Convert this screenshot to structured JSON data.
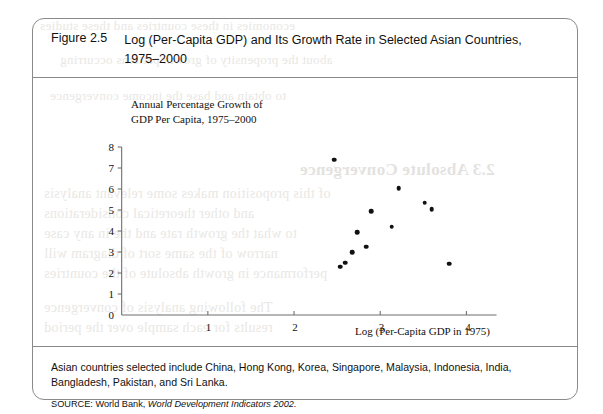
{
  "figure": {
    "number": "Figure 2.5",
    "title": "Log (Per-Capita GDP) and Its Growth Rate in Selected Asian Countries, 1975–2000",
    "note": "Asian countries selected include China, Hong Kong, Korea, Singapore, Malaysia, Indonesia, India, Bangladesh, Pakistan, and Sri Lanka.",
    "source_prefix": "SOURCE: World Bank, ",
    "source_italic": "World Development Indicators 2002."
  },
  "chart_data": {
    "type": "scatter",
    "title": "",
    "ylabel": "Annual Percentage Growth of GDP Per Capita, 1975–2000",
    "xlabel": "Log (Per-Capita GDP in 1975)",
    "xlim": [
      0,
      4.35
    ],
    "ylim": [
      0,
      8
    ],
    "xticks": [
      1,
      2,
      3,
      4
    ],
    "yticks": [
      0,
      1,
      2,
      3,
      4,
      5,
      6,
      7,
      8
    ],
    "xtick_labels": [
      "1",
      "2",
      "3",
      "4"
    ],
    "ytick_labels": [
      "0",
      "1",
      "2",
      "3",
      "4",
      "5",
      "6",
      "7",
      "8"
    ],
    "grid": false,
    "legend": false,
    "marker_color": "#111111",
    "points": [
      {
        "x": 2.45,
        "y": 7.4
      },
      {
        "x": 3.2,
        "y": 6.05
      },
      {
        "x": 3.5,
        "y": 5.35
      },
      {
        "x": 3.58,
        "y": 5.05
      },
      {
        "x": 2.88,
        "y": 4.95
      },
      {
        "x": 3.12,
        "y": 4.2
      },
      {
        "x": 2.72,
        "y": 3.95
      },
      {
        "x": 2.82,
        "y": 3.25
      },
      {
        "x": 2.66,
        "y": 3.0
      },
      {
        "x": 2.58,
        "y": 2.5
      },
      {
        "x": 2.52,
        "y": 2.3
      },
      {
        "x": 3.78,
        "y": 2.45
      }
    ]
  },
  "bleed_text": {
    "l1": "economies in these countries and these studies",
    "l2": "about the propensity of growth patterns occurring",
    "l3": "to obtain and base the income convergence",
    "l4": "of this proposition makes some relevant analysis",
    "l5": "and other theoretical considerations",
    "l6": "to what the growth rate and the in any case",
    "l7": "narrow of the same sort of diagram will",
    "l8": "performance in growth absolute of the countries",
    "l9": "The following analysis of convergence",
    "l10": "results for each sample over the period",
    "title": "2.3 Absolute Convergence"
  }
}
